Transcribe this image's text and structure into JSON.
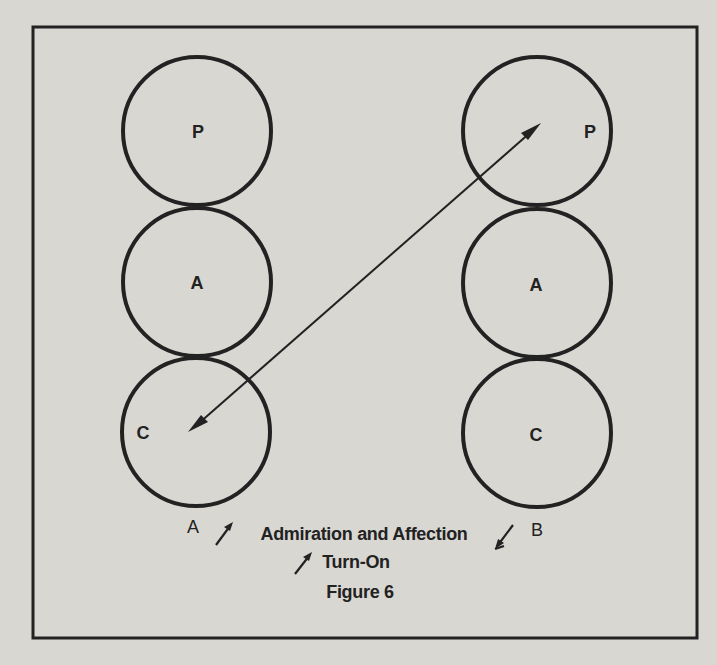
{
  "figure": {
    "title": "Figure 6",
    "frame_color": "#222222",
    "background_color": "#d9d7d2"
  },
  "columns": [
    {
      "id": "A",
      "label": "A",
      "circles": [
        {
          "letter": "P"
        },
        {
          "letter": "A"
        },
        {
          "letter": "C"
        }
      ]
    },
    {
      "id": "B",
      "label": "B",
      "circles": [
        {
          "letter": "P"
        },
        {
          "letter": "A"
        },
        {
          "letter": "C"
        }
      ]
    }
  ],
  "transaction": {
    "from": "B.P",
    "to": "A.C",
    "bidirectional": true
  },
  "caption": {
    "line1": "Admiration and Affection",
    "line2": "Turn-On",
    "arrow_a_icon": "up-right-arrow",
    "arrow_b_icon": "down-left-arrow",
    "arrow_turnon_icon": "up-right-arrow"
  }
}
